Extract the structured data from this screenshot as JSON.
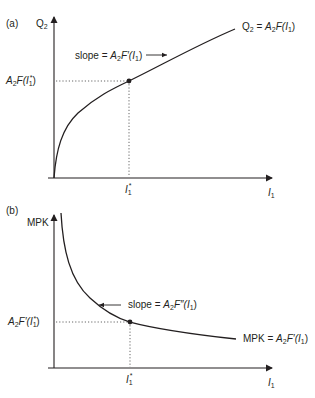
{
  "figure": {
    "panel_a": {
      "panel_label": "(a)",
      "y_axis_label": "Q",
      "y_axis_sub": "2",
      "x_axis_label": "I",
      "x_axis_sub": "1",
      "x_tick": {
        "main": "I",
        "sub": "1",
        "sup": "*"
      },
      "y_tick": {
        "pre": "A",
        "pre_sub": "2",
        "func": "F(",
        "var": "I",
        "var_sub": "1",
        "var_sup": "*",
        "close": ")"
      },
      "curve_label": {
        "lhs": "Q",
        "lhs_sub": "2",
        "eq": " = ",
        "a": "A",
        "a_sub": "2",
        "f": "F(",
        "var": "I",
        "var_sub": "1",
        "close": ")"
      },
      "slope_label": {
        "text": "slope = ",
        "a": "A",
        "a_sub": "2",
        "f": "F′(",
        "var": "I",
        "var_sub": "1",
        "close": ")"
      },
      "curve_type": "concave increasing (square-root shape)",
      "marked_point": "(I1*, A2F(I1*))"
    },
    "panel_b": {
      "panel_label": "(b)",
      "y_axis_label": "MPK",
      "x_axis_label": "I",
      "x_axis_sub": "1",
      "x_tick": {
        "main": "I",
        "sub": "1",
        "sup": "*"
      },
      "y_tick": {
        "pre": "A",
        "pre_sub": "2",
        "func": "F′(",
        "var": "I",
        "var_sub": "1",
        "var_sup": "*",
        "close": ")"
      },
      "curve_label": {
        "lhs": "MPK",
        "eq": " = ",
        "a": "A",
        "a_sub": "2",
        "f": "F′(",
        "var": "I",
        "var_sub": "1",
        "close": ")"
      },
      "slope_label": {
        "text": "slope = ",
        "a": "A",
        "a_sub": "2",
        "f": "F″(",
        "var": "I",
        "var_sub": "1",
        "close": ")"
      },
      "curve_type": "convex decreasing",
      "marked_point": "(I1*, A2F'(I1*))"
    },
    "colors": {
      "ink": "#231f20",
      "guide": "#555555",
      "background": "#ffffff"
    }
  }
}
